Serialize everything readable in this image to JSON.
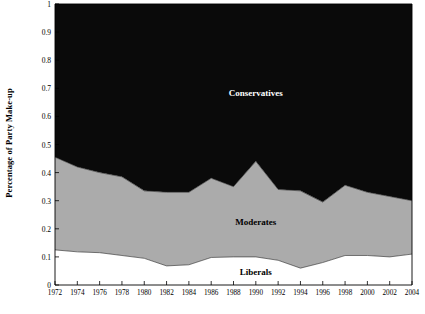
{
  "chart_data": {
    "type": "area",
    "stacked": true,
    "title": "",
    "xlabel": "",
    "ylabel": "Percentage of Party Make-up",
    "xlim": [
      1972,
      2004
    ],
    "ylim": [
      0,
      1
    ],
    "grid": false,
    "legend_position": "inline-labels",
    "x": [
      1972,
      1974,
      1976,
      1978,
      1980,
      1982,
      1984,
      1986,
      1988,
      1990,
      1992,
      1994,
      1996,
      1998,
      2000,
      2002,
      2004
    ],
    "xtick_labels": [
      "1972",
      "1974",
      "1976",
      "1978",
      "1980",
      "1982",
      "1984",
      "1986",
      "1988",
      "1990",
      "1992",
      "1994",
      "1996",
      "1998",
      "2000",
      "2002",
      "2004"
    ],
    "ytick_labels": [
      "0",
      "0.1",
      "0.2",
      "0.3",
      "0.4",
      "0.5",
      "0.6",
      "0.7",
      "0.8",
      "0.9",
      "1"
    ],
    "ytick_values": [
      0,
      0.1,
      0.2,
      0.3,
      0.4,
      0.5,
      0.6,
      0.7,
      0.8,
      0.9,
      1
    ],
    "series": [
      {
        "name": "Liberals",
        "color": "#FFFFFF",
        "label_color": "#000000",
        "label_x": 1990,
        "label_y": 0.045,
        "values": [
          0.125,
          0.118,
          0.115,
          0.105,
          0.095,
          0.068,
          0.072,
          0.098,
          0.1,
          0.1,
          0.088,
          0.06,
          0.08,
          0.105,
          0.105,
          0.1,
          0.11
        ]
      },
      {
        "name": "Moderates",
        "color": "#ABABAB",
        "label_color": "#000000",
        "label_x": 1990,
        "label_y": 0.225,
        "values": [
          0.33,
          0.302,
          0.285,
          0.28,
          0.24,
          0.262,
          0.258,
          0.282,
          0.25,
          0.34,
          0.252,
          0.275,
          0.215,
          0.25,
          0.225,
          0.215,
          0.19
        ]
      },
      {
        "name": "Conservatives",
        "color": "#0A0A0A",
        "label_color": "#FFFFFF",
        "label_x": 1990,
        "label_y": 0.685,
        "values": [
          0.545,
          0.58,
          0.6,
          0.615,
          0.665,
          0.67,
          0.67,
          0.62,
          0.65,
          0.56,
          0.66,
          0.665,
          0.705,
          0.645,
          0.67,
          0.685,
          0.7
        ]
      }
    ],
    "cumulative_boundaries": {
      "liberals_top": [
        0.125,
        0.118,
        0.115,
        0.105,
        0.095,
        0.068,
        0.072,
        0.098,
        0.1,
        0.1,
        0.088,
        0.06,
        0.08,
        0.105,
        0.105,
        0.1,
        0.11
      ],
      "moderates_top": [
        0.455,
        0.42,
        0.4,
        0.385,
        0.335,
        0.33,
        0.33,
        0.38,
        0.35,
        0.44,
        0.34,
        0.335,
        0.295,
        0.355,
        0.33,
        0.315,
        0.3
      ]
    }
  },
  "axes": {
    "plot_left": 55,
    "plot_right": 412,
    "plot_top": 4,
    "plot_bottom": 285,
    "axis_color": "#000000"
  }
}
